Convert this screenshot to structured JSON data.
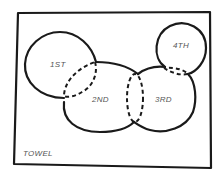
{
  "diagram": {
    "container": {
      "label": "TOWEL"
    },
    "regions": [
      {
        "id": "first",
        "label": "1ST"
      },
      {
        "id": "second",
        "label": "2ND"
      },
      {
        "id": "third",
        "label": "3RD"
      },
      {
        "id": "fourth",
        "label": "4TH"
      }
    ],
    "colors": {
      "stroke": "#1a1a1a",
      "label": "#555555",
      "background": "#ffffff"
    }
  }
}
